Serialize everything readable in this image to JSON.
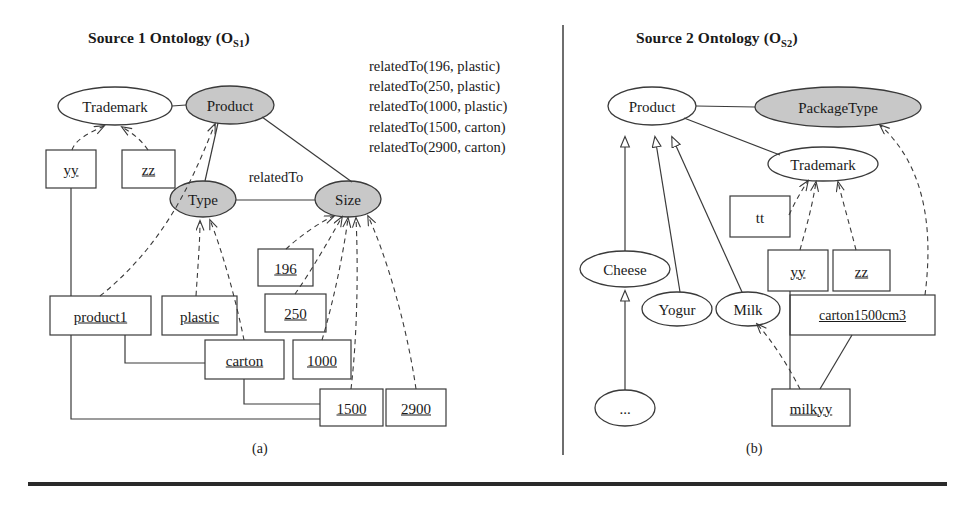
{
  "figure": {
    "panel_a": {
      "title_main": "Source 1 Ontology (O",
      "title_sub": "S1",
      "title_end": ")",
      "caption": "(a)",
      "classes": [
        {
          "name": "Trademark",
          "shaded": false,
          "cx": 115,
          "cy": 106,
          "rx": 57,
          "ry": 19
        },
        {
          "name": "Product",
          "shaded": true,
          "cx": 230,
          "cy": 105,
          "rx": 44,
          "ry": 19
        },
        {
          "name": "Type",
          "shaded": true,
          "cx": 203,
          "cy": 199,
          "rx": 33,
          "ry": 18
        },
        {
          "name": "Size",
          "shaded": true,
          "cx": 348,
          "cy": 199,
          "rx": 33,
          "ry": 18
        }
      ],
      "edge_labels": [
        {
          "text": "relatedTo",
          "x": 276,
          "y": 177
        }
      ],
      "instances": [
        {
          "name": "yy",
          "x": 46,
          "y": 150,
          "w": 50,
          "h": 38
        },
        {
          "name": "zz",
          "x": 122,
          "y": 150,
          "w": 53,
          "h": 38
        },
        {
          "name": "product1",
          "x": 50,
          "y": 296,
          "w": 101,
          "h": 39
        },
        {
          "name": "plastic",
          "x": 162,
          "y": 296,
          "w": 75,
          "h": 39
        },
        {
          "name": "196",
          "x": 258,
          "y": 249,
          "w": 55,
          "h": 37
        },
        {
          "name": "250",
          "x": 265,
          "y": 294,
          "w": 61,
          "h": 38
        },
        {
          "name": "carton",
          "x": 205,
          "y": 340,
          "w": 79,
          "h": 39
        },
        {
          "name": "1000",
          "x": 293,
          "y": 340,
          "w": 58,
          "h": 39
        },
        {
          "name": "1500",
          "x": 320,
          "y": 389,
          "w": 63,
          "h": 37
        },
        {
          "name": "2900",
          "x": 386,
          "y": 389,
          "w": 60,
          "h": 37
        }
      ],
      "predicates": [
        "relatedTo(196, plastic)",
        "relatedTo(250, plastic)",
        "relatedTo(1000, plastic)",
        "relatedTo(1500, carton)",
        "relatedTo(2900, carton)"
      ]
    },
    "panel_b": {
      "title_main": "Source 2 Ontology (O",
      "title_sub": "S2",
      "title_end": ")",
      "caption": "(b)",
      "classes": [
        {
          "name": "Product",
          "shaded": false,
          "cx": 652,
          "cy": 106,
          "rx": 44,
          "ry": 19
        },
        {
          "name": "PackageType",
          "shaded": true,
          "cx": 838,
          "cy": 107,
          "rx": 83,
          "ry": 20
        },
        {
          "name": "Trademark",
          "shaded": false,
          "cx": 823,
          "cy": 164,
          "rx": 55,
          "ry": 17
        },
        {
          "name": "Cheese",
          "shaded": false,
          "cx": 625,
          "cy": 269,
          "rx": 45,
          "ry": 18
        },
        {
          "name": "Yogur",
          "shaded": false,
          "cx": 677,
          "cy": 309,
          "rx": 35,
          "ry": 17
        },
        {
          "name": "Milk",
          "shaded": false,
          "cx": 748,
          "cy": 309,
          "rx": 32,
          "ry": 17
        },
        {
          "name": "...",
          "shaded": false,
          "cx": 625,
          "cy": 408,
          "rx": 30,
          "ry": 18
        }
      ],
      "instances": [
        {
          "name": "tt",
          "x": 730,
          "y": 196,
          "w": 60,
          "h": 41,
          "underline": false
        },
        {
          "name": "yy",
          "x": 768,
          "y": 250,
          "w": 60,
          "h": 41,
          "underline": true
        },
        {
          "name": "zz",
          "x": 833,
          "y": 250,
          "w": 57,
          "h": 41,
          "underline": true
        },
        {
          "name": "carton1500cm3",
          "x": 790,
          "y": 295,
          "w": 145,
          "h": 40,
          "underline": true
        },
        {
          "name": "milkyy",
          "x": 772,
          "y": 389,
          "w": 78,
          "h": 37,
          "underline": true
        }
      ]
    },
    "colors": {
      "shaded_fill": "#c8c8c8",
      "stroke": "#3a3a3a",
      "rule": "#2a2a2a"
    }
  }
}
